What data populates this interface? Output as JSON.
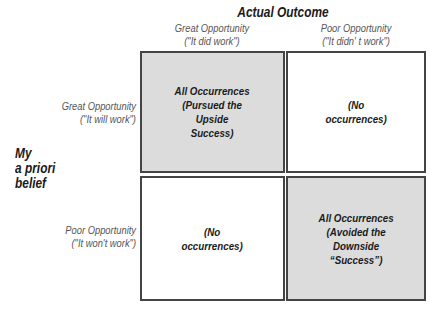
{
  "diagram": {
    "column_axis_title": "Actual Outcome",
    "row_axis_title": "My\na priori\nbelief",
    "columns": [
      {
        "line1": "Great Opportunity",
        "line2": "(\"It did work\")"
      },
      {
        "line1": "Poor Opportunity",
        "line2": "(\"It didn' t work\")"
      }
    ],
    "rows": [
      {
        "line1": "Great Opportunity",
        "line2": "(\"It will work\")"
      },
      {
        "line1": "Poor Opportunity",
        "line2": "(\"It won't work\")"
      }
    ],
    "cells": [
      {
        "text": "All Occurrences\n(Pursued the\nUpside\nSuccess)",
        "shaded": true
      },
      {
        "text": "(No\noccurrences)",
        "shaded": false
      },
      {
        "text": "(No\noccurrences)",
        "shaded": false
      },
      {
        "text": "All Occurrences\n(Avoided the\nDownside\n“Success”)",
        "shaded": true
      }
    ],
    "colors": {
      "shaded_fill": "#dcdcdc",
      "border": "#444444"
    }
  }
}
